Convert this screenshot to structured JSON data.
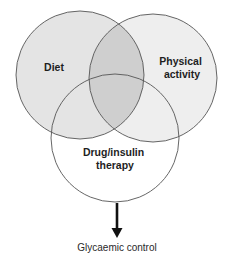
{
  "diagram": {
    "type": "venn",
    "sets": [
      {
        "id": "diet",
        "label_lines": [
          "Diet"
        ],
        "fill": "#e4e4e4"
      },
      {
        "id": "physical",
        "label_lines": [
          "Physical",
          "activity"
        ],
        "fill": "#eeeeee"
      },
      {
        "id": "drug",
        "label_lines": [
          "Drug/insulin",
          "therapy"
        ],
        "fill": "#ffffff"
      }
    ],
    "overlap_fill": "#cfcfcf",
    "stroke_color": "#555555",
    "arrow_color": "#111111",
    "outcome": "Glycaemic control"
  }
}
